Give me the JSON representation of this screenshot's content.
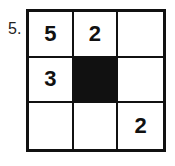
{
  "puzzle": {
    "number_label": "5.",
    "grid": [
      [
        "5",
        "2",
        ""
      ],
      [
        "3",
        "#",
        ""
      ],
      [
        "",
        "",
        "2"
      ]
    ],
    "colors": {
      "line": "#111111",
      "shaded": "#111111",
      "background": "#ffffff"
    }
  }
}
